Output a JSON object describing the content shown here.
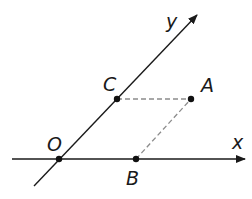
{
  "diagram": {
    "title": "",
    "axes": {
      "x": {
        "label": "x"
      },
      "y": {
        "label": "y"
      }
    },
    "points": [
      {
        "id": "O",
        "label": "O",
        "x": 59,
        "y": 159
      },
      {
        "id": "B",
        "label": "B",
        "x": 136,
        "y": 159
      },
      {
        "id": "C",
        "label": "C",
        "x": 117,
        "y": 99
      },
      {
        "id": "A",
        "label": "A",
        "x": 191,
        "y": 99
      }
    ],
    "dashed_segments": [
      {
        "from": "C",
        "to": "A"
      },
      {
        "from": "B",
        "to": "A"
      }
    ],
    "colors": {
      "line": "#1a1a1a",
      "dashed": "#8c8c8c",
      "point": "#111111"
    }
  }
}
